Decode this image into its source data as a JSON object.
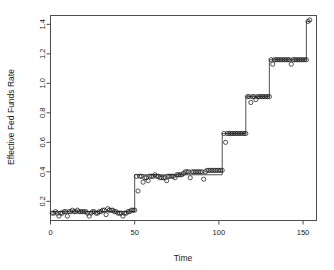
{
  "chart_data": {
    "type": "line",
    "title": "",
    "subtitle": "",
    "xlabel": "Time",
    "ylabel": "Effective Fed Funds Rate",
    "xlim": [
      0,
      158
    ],
    "ylim": [
      0.07,
      1.46
    ],
    "xticks": [
      0,
      50,
      100,
      150
    ],
    "xtick_labels": [
      "0",
      "50",
      "100",
      "150"
    ],
    "yticks": [
      0.2,
      0.4,
      0.6,
      0.8,
      1.0,
      1.2,
      1.4
    ],
    "ytick_labels": [
      "0.2",
      "0.4",
      "0.6",
      "0.8",
      "1.0",
      "1.2",
      "1.4"
    ],
    "grid": false,
    "legend": null,
    "marker": "open-circle",
    "line_style": "solid",
    "series": [
      {
        "name": "Effective Fed Funds Rate",
        "color": "#1c1c1c",
        "x": [
          1,
          2,
          3,
          4,
          5,
          6,
          7,
          8,
          9,
          10,
          11,
          12,
          13,
          14,
          15,
          16,
          17,
          18,
          19,
          20,
          21,
          22,
          23,
          24,
          25,
          26,
          27,
          28,
          29,
          30,
          31,
          32,
          33,
          34,
          35,
          36,
          37,
          38,
          39,
          40,
          41,
          42,
          43,
          44,
          45,
          46,
          47,
          48,
          49,
          50,
          51,
          52,
          53,
          54,
          55,
          56,
          57,
          58,
          59,
          60,
          61,
          62,
          63,
          64,
          65,
          66,
          67,
          68,
          69,
          70,
          71,
          72,
          73,
          74,
          75,
          76,
          77,
          78,
          79,
          80,
          81,
          82,
          83,
          84,
          85,
          86,
          87,
          88,
          89,
          90,
          91,
          92,
          93,
          94,
          95,
          96,
          97,
          98,
          99,
          100,
          101,
          102,
          103,
          104,
          105,
          106,
          107,
          108,
          109,
          110,
          111,
          112,
          113,
          114,
          115,
          116,
          117,
          118,
          119,
          120,
          121,
          122,
          123,
          124,
          125,
          126,
          127,
          128,
          129,
          130,
          131,
          132,
          133,
          134,
          135,
          136,
          137,
          138,
          139,
          140,
          141,
          142,
          143,
          144,
          145,
          146,
          147,
          148,
          149,
          150,
          151,
          152,
          153,
          154
        ],
        "y": [
          0.12,
          0.12,
          0.13,
          0.12,
          0.1,
          0.12,
          0.12,
          0.13,
          0.13,
          0.1,
          0.13,
          0.13,
          0.14,
          0.13,
          0.13,
          0.14,
          0.13,
          0.13,
          0.13,
          0.13,
          0.13,
          0.12,
          0.1,
          0.12,
          0.13,
          0.13,
          0.12,
          0.12,
          0.13,
          0.13,
          0.14,
          0.14,
          0.11,
          0.15,
          0.14,
          0.14,
          0.14,
          0.13,
          0.13,
          0.12,
          0.12,
          0.12,
          0.1,
          0.12,
          0.12,
          0.13,
          0.13,
          0.14,
          0.14,
          0.14,
          0.37,
          0.27,
          0.37,
          0.37,
          0.33,
          0.36,
          0.36,
          0.34,
          0.37,
          0.37,
          0.37,
          0.38,
          0.37,
          0.37,
          0.36,
          0.36,
          0.36,
          0.36,
          0.34,
          0.37,
          0.37,
          0.37,
          0.37,
          0.36,
          0.38,
          0.38,
          0.38,
          0.38,
          0.39,
          0.4,
          0.4,
          0.4,
          0.36,
          0.4,
          0.4,
          0.4,
          0.4,
          0.4,
          0.4,
          0.4,
          0.35,
          0.4,
          0.41,
          0.41,
          0.41,
          0.41,
          0.41,
          0.41,
          0.41,
          0.41,
          0.41,
          0.41,
          0.66,
          0.6,
          0.66,
          0.66,
          0.66,
          0.66,
          0.66,
          0.66,
          0.66,
          0.66,
          0.66,
          0.66,
          0.66,
          0.66,
          0.91,
          0.91,
          0.87,
          0.91,
          0.91,
          0.89,
          0.91,
          0.91,
          0.91,
          0.91,
          0.91,
          0.91,
          0.91,
          0.91,
          1.16,
          1.13,
          1.16,
          1.16,
          1.16,
          1.16,
          1.16,
          1.16,
          1.16,
          1.16,
          1.16,
          1.16,
          1.13,
          1.16,
          1.16,
          1.16,
          1.16,
          1.16,
          1.16,
          1.16,
          1.16,
          1.16,
          1.42,
          1.43
        ]
      }
    ],
    "step_levels": [
      {
        "start": 1,
        "end": 50,
        "level": 0.13
      },
      {
        "start": 51,
        "end": 102,
        "level": 0.38
      },
      {
        "start": 103,
        "end": 116,
        "level": 0.66
      },
      {
        "start": 117,
        "end": 130,
        "level": 0.91
      },
      {
        "start": 131,
        "end": 152,
        "level": 1.16
      },
      {
        "start": 153,
        "end": 154,
        "level": 1.42
      }
    ]
  },
  "axes": {
    "xlabel": "Time",
    "ylabel": "Effective Fed Funds Rate"
  }
}
